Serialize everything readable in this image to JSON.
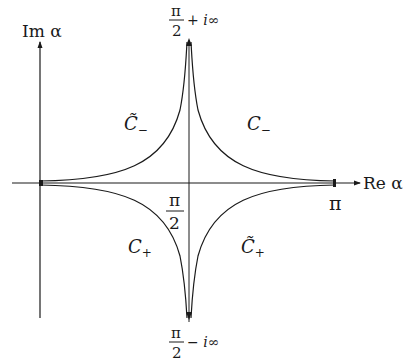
{
  "axes": {
    "y_label": "Im α",
    "x_label": "Re α"
  },
  "ticks": {
    "pi": "π",
    "half_num": "π",
    "half_den": "2"
  },
  "top_label": {
    "num": "π",
    "den": "2",
    "suffix": "+ i∞"
  },
  "bottom_label": {
    "num": "π",
    "den": "2",
    "suffix": "− i∞"
  },
  "contours": {
    "upper_left": "C̃",
    "upper_left_sub": "−",
    "upper_right": "C",
    "upper_right_sub": "−",
    "lower_left": "C",
    "lower_left_sub": "+",
    "lower_right": "C̃",
    "lower_right_sub": "+"
  },
  "colors": {
    "stroke": "#1a1a1a",
    "background": "#ffffff"
  }
}
